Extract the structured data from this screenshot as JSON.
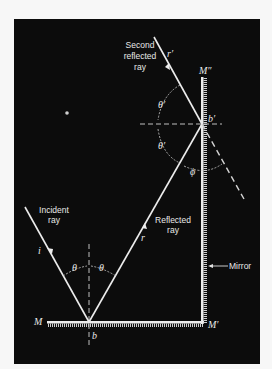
{
  "diagram": {
    "labels": {
      "second_reflected_ray_line1": "Second",
      "second_reflected_ray_line2": "reflected",
      "second_reflected_ray_line3": "ray",
      "incident_ray_line1": "Incident",
      "incident_ray_line2": "ray",
      "reflected_ray_line1": "Reflected",
      "reflected_ray_line2": "ray",
      "mirror": "Mirror",
      "M": "M",
      "M_prime": "M′",
      "M_double_prime": "M″",
      "b": "b",
      "b_prime": "b′",
      "i": "i",
      "r": "r",
      "r_prime": "r′",
      "theta": "θ",
      "theta_prime": "θ′",
      "phi": "ϕ"
    },
    "colors": {
      "background": "#0c0c0c",
      "page": "#f7f7f7",
      "lines": "#e8e8e8"
    }
  }
}
